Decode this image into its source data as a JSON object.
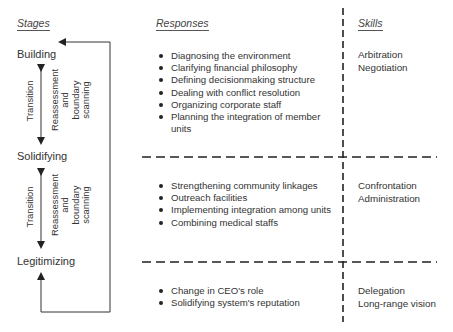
{
  "headers": {
    "stages": "Stages",
    "responses": "Responses",
    "skills": "Skills"
  },
  "stages": [
    {
      "name": "Building"
    },
    {
      "name": "Solidifying"
    },
    {
      "name": "Legitimizing"
    }
  ],
  "transitions": [
    {
      "label": "Transition",
      "process_lines": [
        "Reassessment",
        "and",
        "boundary",
        "scanning"
      ]
    },
    {
      "label": "Transition",
      "process_lines": [
        "Reassessment",
        "and",
        "boundary",
        "scanning"
      ]
    }
  ],
  "rows": [
    {
      "responses": [
        "Diagnosing the environment",
        "Clarifying financial philosophy",
        "Defining decisionmaking structure",
        "Dealing with conflict resolution",
        "Organizing corporate staff",
        "Planning the integration of member units"
      ],
      "skills": [
        "Arbitration",
        "Negotiation"
      ]
    },
    {
      "responses": [
        "Strengthening community linkages",
        "Outreach facilities",
        "Implementing integration among units",
        "Combining medical staffs"
      ],
      "skills": [
        "Confrontation",
        "Administration"
      ]
    },
    {
      "responses": [
        "Change in CEO's role",
        "Solidifying system's reputation"
      ],
      "skills": [
        "Delegation",
        "Long-range vision"
      ]
    }
  ]
}
